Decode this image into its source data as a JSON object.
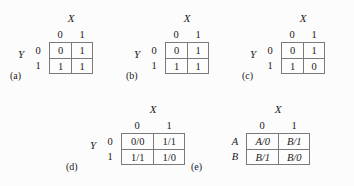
{
  "figure": {
    "background_color": "#fcfcfc",
    "line_color": "#7a7a7a",
    "text_color": "#1a1a1a"
  },
  "tables": [
    {
      "id": "a",
      "caption": "(a)",
      "top_label": "X",
      "side_label": "Y",
      "col_headers": [
        "0",
        "1"
      ],
      "row_headers": [
        "0",
        "1"
      ],
      "rows": [
        [
          "0",
          "1"
        ],
        [
          "1",
          "1"
        ]
      ]
    },
    {
      "id": "b",
      "caption": "(b)",
      "top_label": "X",
      "side_label": "Y",
      "col_headers": [
        "0",
        "1"
      ],
      "row_headers": [
        "0",
        "1"
      ],
      "rows": [
        [
          "0",
          "1"
        ],
        [
          "1",
          "1"
        ]
      ]
    },
    {
      "id": "c",
      "caption": "(c)",
      "top_label": "X",
      "side_label": "Y",
      "col_headers": [
        "0",
        "1"
      ],
      "row_headers": [
        "0",
        "1"
      ],
      "rows": [
        [
          "0",
          "1"
        ],
        [
          "1",
          "0"
        ]
      ]
    },
    {
      "id": "d",
      "caption": "(d)",
      "top_label": "X",
      "side_label": "Y",
      "col_headers": [
        "0",
        "1"
      ],
      "row_headers": [
        "0",
        "1"
      ],
      "rows": [
        [
          "0/0",
          "1/1"
        ],
        [
          "1/1",
          "1/0"
        ]
      ]
    },
    {
      "id": "e",
      "caption": "(e)",
      "top_label": "X",
      "side_label": "",
      "col_headers": [
        "0",
        "1"
      ],
      "row_headers": [
        "A",
        "B"
      ],
      "rows": [
        [
          "A/0",
          "B/1"
        ],
        [
          "B/1",
          "B/0"
        ]
      ]
    }
  ]
}
